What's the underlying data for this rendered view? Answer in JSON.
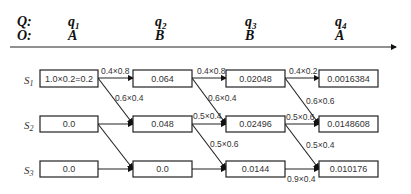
{
  "header": {
    "q_label": "Q:",
    "o_label": "O:",
    "columns": [
      {
        "q": "q",
        "q_sub": "1",
        "o": "A"
      },
      {
        "q": "q",
        "q_sub": "2",
        "o": "B"
      },
      {
        "q": "q",
        "q_sub": "3",
        "o": "B"
      },
      {
        "q": "q",
        "q_sub": "4",
        "o": "A"
      }
    ]
  },
  "states": [
    {
      "name": "S",
      "sub": "1"
    },
    {
      "name": "S",
      "sub": "2"
    },
    {
      "name": "S",
      "sub": "3"
    }
  ],
  "trellis": {
    "values": [
      [
        "1.0×0.2=0.2",
        "0.064",
        "0.02048",
        "0.0016384"
      ],
      [
        "0.0",
        "0.048",
        "0.02496",
        "0.0148608"
      ],
      [
        "0.0",
        "0.0",
        "0.0144",
        "0.010176"
      ]
    ],
    "edge_labels": {
      "t1_s1_s1": "0.4×0.8",
      "t1_s1_s2": "0.6×0.4",
      "t2_s1_s1": "0.4×0.8",
      "t2_s1_s2": "0.6×0.4",
      "t2_s2_s2": "0.5×0.4",
      "t2_s2_s3": "0.5×0.6",
      "t3_s1_s1": "0.4×0.2",
      "t3_s1_s2": "0.6×0.6",
      "t3_s2_s2": "0.5×0.6",
      "t3_s2_s3": "0.5×0.4",
      "t3_s3_s3": "0.9×0.4"
    }
  }
}
